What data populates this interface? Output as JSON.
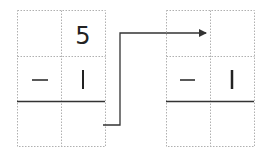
{
  "diagram": {
    "left_grid": {
      "rows": [
        [
          "",
          "5"
        ],
        [
          "—",
          "1"
        ],
        [
          "",
          ""
        ]
      ]
    },
    "right_grid": {
      "rows": [
        [
          "",
          ""
        ],
        [
          "—",
          "1"
        ],
        [
          "",
          ""
        ]
      ]
    },
    "colors": {
      "grid": "#b0b0b0",
      "line": "#333333",
      "text": "#222222"
    }
  }
}
